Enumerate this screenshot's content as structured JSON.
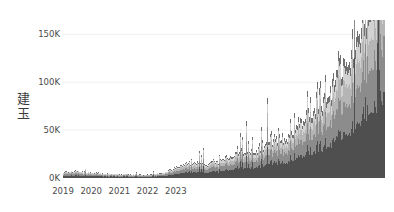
{
  "chart_data": {
    "type": "area",
    "stacked": true,
    "title": "",
    "xlabel": "",
    "ylabel": "建玉",
    "ylim": [
      0,
      165000
    ],
    "xlim": [
      "2019-01-01",
      "2023-10-01"
    ],
    "grid": true,
    "grid_axis": "y",
    "legend": "none",
    "ytick_labels": [
      "0K",
      "50K",
      "100K",
      "150K"
    ],
    "ytick_values": [
      0,
      50000,
      100000,
      150000
    ],
    "xtick_labels": [
      "2019",
      "2020",
      "2021",
      "2022",
      "2023"
    ],
    "xtick_values": [
      "2019-01-01",
      "2020-01-01",
      "2021-01-01",
      "2022-01-01",
      "2023-01-01"
    ],
    "series": [
      {
        "name": "series-1",
        "color": "#4f4f4f",
        "values": [
          2100,
          2400,
          2300,
          2600,
          2500,
          2800,
          2700,
          2600,
          2400,
          2500,
          2300,
          2200,
          2100,
          2000,
          1900,
          2000,
          1800,
          1700,
          1900,
          1800,
          1700,
          1600,
          1500,
          1600,
          1500,
          1400,
          1500,
          1600,
          1500,
          1400,
          1300,
          1400,
          1500,
          1400,
          1300,
          1200,
          1300,
          1400,
          1500,
          1600,
          1700,
          1900,
          2100,
          2400,
          2700,
          3000,
          3400,
          3800,
          4200,
          4700,
          5200,
          5600,
          6000,
          6400,
          6100,
          5800,
          6200,
          6600,
          6300,
          6000,
          5600,
          5900,
          6300,
          6700,
          7100,
          6800,
          6500,
          6900,
          7300,
          7700,
          8100,
          8500,
          8900,
          9300,
          9800,
          10200,
          10700,
          11100,
          11600,
          12000,
          11500,
          11000,
          11600,
          12200,
          12800,
          13400,
          14000,
          14700,
          15300,
          16000,
          16700,
          17400,
          16800,
          16200,
          16900,
          17600,
          18300,
          19000,
          19800,
          20600,
          21400,
          22300,
          23200,
          24100,
          25100,
          26100,
          27200,
          28300,
          29400,
          30600,
          31800,
          33100,
          34400,
          35800,
          37200,
          38700,
          40200,
          41800,
          43500,
          45200,
          47000,
          48900,
          50800,
          52800,
          54900,
          57000,
          59200,
          61500,
          63900,
          66400,
          69000,
          71700,
          74500,
          77400,
          80400,
          83500,
          86700,
          90000
        ]
      },
      {
        "name": "series-2",
        "color": "#8c8c8c",
        "values": [
          1600,
          1800,
          1700,
          1900,
          1800,
          2000,
          1900,
          1800,
          1700,
          1800,
          1700,
          1600,
          1500,
          1400,
          1300,
          1400,
          1300,
          1200,
          1300,
          1200,
          1100,
          1100,
          1000,
          1100,
          1000,
          950,
          1000,
          1100,
          1000,
          950,
          900,
          950,
          1000,
          950,
          900,
          850,
          900,
          950,
          1000,
          1100,
          1200,
          1300,
          1450,
          1600,
          1800,
          2000,
          2250,
          2500,
          2800,
          3100,
          3400,
          3700,
          4000,
          4250,
          4000,
          3800,
          4100,
          4350,
          4150,
          3950,
          3700,
          3900,
          4150,
          4400,
          4700,
          4500,
          4300,
          4550,
          4800,
          5100,
          5350,
          5600,
          5900,
          6150,
          6450,
          6750,
          7050,
          7350,
          7650,
          7950,
          7600,
          7250,
          7650,
          8050,
          8450,
          8850,
          9250,
          9700,
          10100,
          10550,
          11000,
          11500,
          11100,
          10700,
          11150,
          11600,
          12050,
          12550,
          13050,
          13600,
          14100,
          14700,
          15300,
          15900,
          16550,
          17200,
          17900,
          18650,
          19400,
          20150,
          20950,
          21800,
          22700,
          23600,
          24500,
          25500,
          26500,
          27500,
          28600,
          29800,
          30950,
          32200,
          33450,
          34750,
          36150,
          37550,
          39000,
          40500,
          42050,
          43700,
          45400,
          47150,
          49000,
          50900,
          52850,
          54900,
          57000,
          59200,
          61500
        ]
      },
      {
        "name": "series-3",
        "color": "#b5b5b5",
        "values": [
          1100,
          1250,
          1200,
          1300,
          1250,
          1400,
          1350,
          1250,
          1200,
          1250,
          1150,
          1100,
          1050,
          1000,
          950,
          1000,
          900,
          850,
          900,
          850,
          800,
          750,
          700,
          750,
          700,
          650,
          700,
          750,
          700,
          650,
          620,
          650,
          700,
          650,
          620,
          580,
          620,
          650,
          700,
          750,
          820,
          900,
          1000,
          1100,
          1250,
          1400,
          1550,
          1750,
          1950,
          2150,
          2350,
          2550,
          2750,
          2950,
          2800,
          2650,
          2850,
          3050,
          2900,
          2750,
          2550,
          2700,
          2900,
          3050,
          3250,
          3100,
          2950,
          3150,
          3350,
          3550,
          3700,
          3900,
          4100,
          4300,
          4500,
          4700,
          4900,
          5100,
          5350,
          5550,
          5300,
          5050,
          5350,
          5600,
          5900,
          6150,
          6450,
          6750,
          7050,
          7350,
          7700,
          8000,
          7700,
          7400,
          7750,
          8050,
          8400,
          8750,
          9100,
          9500,
          9850,
          10250,
          10700,
          11100,
          11550,
          12000,
          12500,
          13000,
          13500,
          14050,
          14600,
          15200,
          15800,
          16400,
          17100,
          17750,
          18450,
          19200,
          19950,
          20750,
          21600,
          22450,
          23350,
          24300,
          25250,
          26250,
          27300,
          28400,
          29500,
          30650,
          31850,
          33100,
          34400,
          35750,
          37150,
          38600,
          40100,
          41650,
          43250,
          44950
        ]
      },
      {
        "name": "series-4",
        "color": "#d2d2d2",
        "values": [
          700,
          800,
          780,
          850,
          820,
          900,
          870,
          810,
          780,
          800,
          750,
          720,
          680,
          650,
          620,
          650,
          590,
          560,
          580,
          550,
          520,
          490,
          460,
          490,
          460,
          430,
          460,
          490,
          460,
          430,
          410,
          430,
          460,
          430,
          410,
          380,
          410,
          430,
          460,
          500,
          540,
          600,
          660,
          730,
          820,
          920,
          1020,
          1150,
          1280,
          1420,
          1550,
          1680,
          1810,
          1940,
          1840,
          1740,
          1870,
          2000,
          1900,
          1800,
          1670,
          1770,
          1900,
          2000,
          2130,
          2030,
          1930,
          2060,
          2190,
          2320,
          2420,
          2550,
          2680,
          2810,
          2940,
          3070,
          3200,
          3330,
          3500,
          3630,
          3470,
          3300,
          3500,
          3660,
          3860,
          4020,
          4220,
          4420,
          4610,
          4810,
          5040,
          5230,
          5040,
          4840,
          5070,
          5270,
          5500,
          5720,
          5950,
          6220,
          6450,
          6700,
          7000,
          7260,
          7560,
          7850,
          8180,
          8500,
          8830,
          9200,
          9550,
          9950,
          10340,
          10750,
          11180,
          11630,
          12100,
          12580,
          13080,
          13600,
          14140,
          14720,
          15300,
          15920,
          16560,
          17220,
          17900,
          18610,
          19350,
          20120,
          20900,
          21730,
          22580,
          23460,
          24380,
          25330,
          26320,
          27340,
          28400,
          29500,
          30650
        ]
      },
      {
        "name": "series-5",
        "color": "#6f6f6f",
        "values": [
          450,
          510,
          500,
          540,
          520,
          570,
          560,
          520,
          500,
          510,
          480,
          460,
          430,
          410,
          395,
          410,
          375,
          355,
          370,
          350,
          330,
          310,
          295,
          310,
          295,
          275,
          295,
          310,
          295,
          275,
          260,
          275,
          295,
          275,
          260,
          245,
          260,
          275,
          295,
          320,
          345,
          380,
          420,
          465,
          520,
          585,
          650,
          730,
          815,
          900,
          985,
          1070,
          1150,
          1235,
          1170,
          1105,
          1190,
          1270,
          1210,
          1145,
          1060,
          1125,
          1210,
          1270,
          1355,
          1290,
          1225,
          1310,
          1395,
          1475,
          1540,
          1620,
          1705,
          1785,
          1870,
          1950,
          2035,
          2115,
          2225,
          2310,
          2205,
          2100,
          2225,
          2330,
          2455,
          2555,
          2685,
          2810,
          2930,
          3060,
          3205,
          3325,
          3205,
          3075,
          3225,
          3350,
          3495,
          3640,
          3780,
          3955,
          4100,
          4260,
          4450,
          4615,
          4805,
          4990,
          5200,
          5405,
          5615,
          5850,
          6075,
          6325,
          6575,
          6835,
          7110,
          7395,
          7690,
          7995,
          8315,
          8645,
          8990,
          9355,
          9730,
          10120,
          10530,
          10950,
          11390,
          11840,
          12310,
          12800,
          13310,
          13830,
          14380,
          14940,
          15520,
          16130,
          16760,
          17410,
          18090,
          18790,
          19520,
          20280
        ]
      }
    ],
    "notes": {
      "peak_label": "~160K",
      "peak_period": "2023",
      "baseline_period": "2019-2020",
      "baseline_value": "~8K"
    }
  }
}
